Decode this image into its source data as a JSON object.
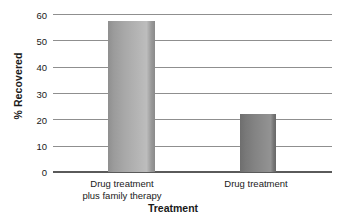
{
  "chart_data": {
    "type": "bar",
    "title": "",
    "xlabel": "Treatment",
    "ylabel": "% Recovered",
    "categories": [
      "Drug treatment plus family therapy",
      "Drug treatment"
    ],
    "category_lines": [
      [
        "Drug treatment",
        "plus family therapy"
      ],
      [
        "Drug treatment"
      ]
    ],
    "values": [
      57.5,
      22
    ],
    "ylim": [
      0,
      60
    ],
    "yticks": [
      0,
      10,
      20,
      30,
      40,
      50,
      60
    ],
    "ytick_labels": [
      "0",
      "10",
      "20",
      "30",
      "40",
      "50",
      "60"
    ],
    "grid": true,
    "grid_axis": "y",
    "legend": false,
    "legend_position": "none",
    "bar_colors": [
      "#b0b0b0",
      "#848484"
    ],
    "grid_color": "#8f8f8f",
    "axis_color": "#5a5a5a",
    "text_color": "#1a1a1a",
    "background": "#ffffff"
  }
}
